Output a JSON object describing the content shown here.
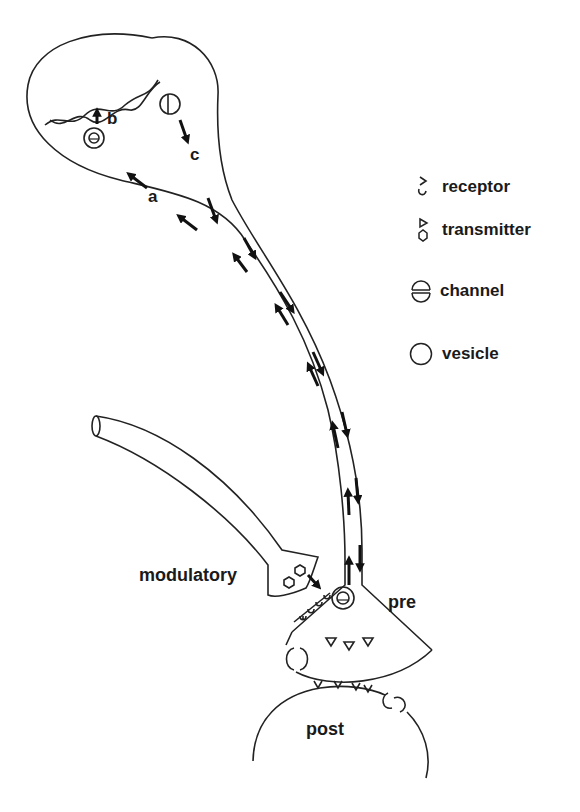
{
  "diagram": {
    "type": "neuron-axonal-transport-schematic",
    "process_labels": {
      "a": "a",
      "b": "b",
      "c": "c"
    },
    "cell_labels": {
      "modulatory": "modulatory",
      "pre": "pre",
      "post": "post"
    },
    "legend": [
      {
        "icon": "receptor-icon",
        "label": "receptor"
      },
      {
        "icon": "transmitter-icon",
        "label": "transmitter"
      },
      {
        "icon": "channel-icon",
        "label": "channel"
      },
      {
        "icon": "vesicle-icon",
        "label": "vesicle"
      }
    ],
    "colors": {
      "stroke": "#222222",
      "text": "#1a1a1a",
      "background": "#ffffff"
    }
  }
}
